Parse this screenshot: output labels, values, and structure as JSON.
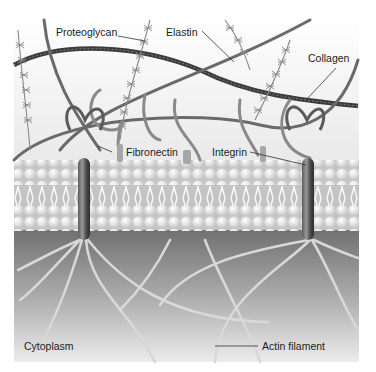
{
  "figure": {
    "labels": {
      "proteoglycan": "Proteoglycan",
      "elastin": "Elastin",
      "collagen": "Collagen",
      "fibronectin": "Fibronectin",
      "integrin": "Integrin",
      "cytoplasm": "Cytoplasm",
      "actin": "Actin filament"
    },
    "colors": {
      "background_top": "#f4f4f4",
      "cytoplasm_top": "#7c7c7c",
      "cytoplasm_bottom": "#e6e6e6",
      "fiber_dark": "#4a4a4a",
      "fiber_mid": "#8a8a8a",
      "lipid_head": "#f2f2f2"
    }
  }
}
